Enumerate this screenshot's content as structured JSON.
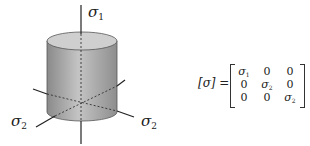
{
  "diagram": {
    "axes": {
      "vertical_label": "σ",
      "vertical_sub": "1",
      "left_label": "σ",
      "left_sub": "2",
      "right_label": "σ",
      "right_sub": "2"
    },
    "shape": "cylinder",
    "colors": {
      "cylinder_fill": "#a8a8a8",
      "top_fill": "#c8c8c8",
      "lines": "#222222"
    }
  },
  "matrix": {
    "lhs": "[σ] =",
    "rows": [
      [
        {
          "sym": "σ",
          "sub": "1"
        },
        {
          "sym": "0",
          "sub": ""
        },
        {
          "sym": "0",
          "sub": ""
        }
      ],
      [
        {
          "sym": "0",
          "sub": ""
        },
        {
          "sym": "σ",
          "sub": "2"
        },
        {
          "sym": "0",
          "sub": ""
        }
      ],
      [
        {
          "sym": "0",
          "sub": ""
        },
        {
          "sym": "0",
          "sub": ""
        },
        {
          "sym": "σ",
          "sub": "2"
        }
      ]
    ]
  }
}
